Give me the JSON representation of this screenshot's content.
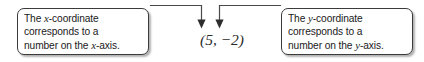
{
  "figure": {
    "name": "coordinate-pair-annotation-diagram",
    "coordinate_pair": "(5, −2)"
  },
  "callout_x": {
    "lines": [
      {
        "pre": "The ",
        "em": "x",
        "post": "-coordinate"
      },
      {
        "pre": "corresponds to a",
        "em": "",
        "post": ""
      },
      {
        "pre": "number on the ",
        "em": "x",
        "post": "-axis."
      }
    ],
    "line1_pre": "The ",
    "line1_em": "x",
    "line1_post": "-coordinate",
    "line2": "corresponds to a",
    "line3_pre": "number on the ",
    "line3_em": "x",
    "line3_post": "-axis."
  },
  "callout_y": {
    "line1_pre": "The ",
    "line1_em": "y",
    "line1_post": "-coordinate",
    "line2": "corresponds to a",
    "line3_pre": "number on the ",
    "line3_em": "y",
    "line3_post": "-axis."
  },
  "colors": {
    "border": "#3b3b3b",
    "text": "#1a1a1a",
    "connector": "#4a4a4a",
    "background": "#ffffff"
  }
}
